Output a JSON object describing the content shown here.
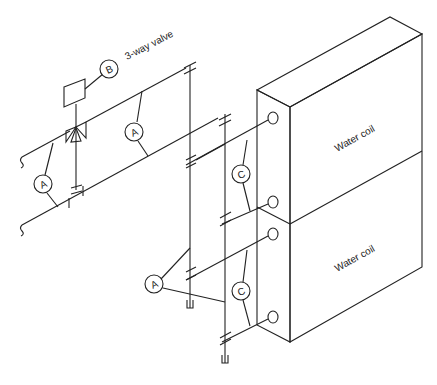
{
  "diagram": {
    "labels": {
      "valve": "3-way valve",
      "coil_upper": "Water coil",
      "coil_lower": "Water coil"
    },
    "callouts": {
      "a1": "A",
      "a2": "A",
      "a3": "A",
      "b": "B",
      "c1": "C",
      "c2": "C"
    },
    "legend_meaning": {
      "A": "pipe connection",
      "B": "3-way valve actuator",
      "C": "coil connection"
    },
    "colors": {
      "line": "#222222",
      "background": "#ffffff"
    }
  }
}
